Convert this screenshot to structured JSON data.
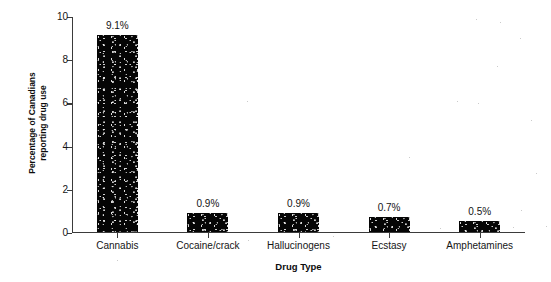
{
  "chart_data": {
    "type": "bar",
    "title": "",
    "xlabel": "Drug Type",
    "ylabel": "Percentage of Canadians\nreporting drug use",
    "categories": [
      "Cannabis",
      "Cocaine/crack",
      "Hallucinogens",
      "Ecstasy",
      "Amphetamines"
    ],
    "values": [
      9.1,
      0.9,
      0.9,
      0.7,
      0.5
    ],
    "value_labels": [
      "9.1%",
      "0.9%",
      "0.9%",
      "0.7%",
      "0.5%"
    ],
    "ylim": [
      0,
      10
    ],
    "ytick_labels": [
      "0",
      "2",
      "4",
      "6",
      "8",
      "10"
    ],
    "ytick_values": [
      0,
      2,
      4,
      6,
      8,
      10
    ],
    "grid": false,
    "legend": "none",
    "bar_color": "#050505",
    "axis_color": "#3b3b3b",
    "background_color": "#ffffff"
  }
}
